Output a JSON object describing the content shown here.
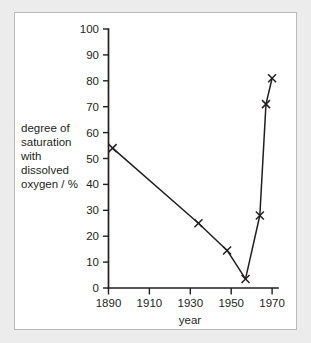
{
  "figure": {
    "background_color": "#ececed",
    "panel_color": "#ffffff",
    "border_color": "#b9b9bb",
    "ink_color": "#231f20"
  },
  "axis_titles": {
    "x": "year",
    "y_lines": [
      "degree of",
      "saturation",
      "with",
      "dissolved",
      "oxygen / %"
    ],
    "y_full": "degree of saturation with dissolved oxygen / %"
  },
  "ticks": {
    "x": [
      "1890",
      "1910",
      "1930",
      "1950",
      "1970"
    ],
    "y": [
      "0",
      "10",
      "20",
      "30",
      "40",
      "50",
      "60",
      "70",
      "80",
      "90",
      "100"
    ]
  },
  "chart_data": {
    "type": "line",
    "title": "",
    "xlabel": "year",
    "ylabel": "degree of saturation with dissolved oxygen / %",
    "xlim": [
      1890,
      1972
    ],
    "ylim": [
      0,
      100
    ],
    "xticks": [
      1890,
      1910,
      1930,
      1950,
      1970
    ],
    "yticks": [
      0,
      10,
      20,
      30,
      40,
      50,
      60,
      70,
      80,
      90,
      100
    ],
    "grid": false,
    "legend": false,
    "marker": "x",
    "series": [
      {
        "name": "degree of saturation with dissolved oxygen",
        "x": [
          1892,
          1934,
          1948,
          1957,
          1964,
          1967,
          1970
        ],
        "values": [
          54,
          25,
          14.5,
          3.5,
          28,
          71,
          81
        ]
      }
    ]
  }
}
